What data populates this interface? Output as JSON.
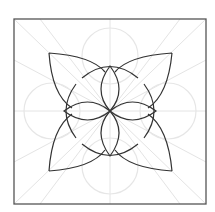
{
  "diagram": {
    "title": "",
    "colors": {
      "background": "#ffffff",
      "frame": "#555555",
      "outline": "#333333",
      "guides": "#e2e2e2"
    }
  }
}
